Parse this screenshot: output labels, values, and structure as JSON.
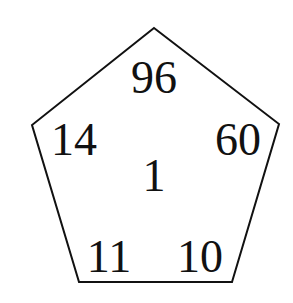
{
  "diagram": {
    "shape": "pentagon",
    "stroke_color": "#111111",
    "vertices": [
      [
        154,
        28
      ],
      [
        279,
        124
      ],
      [
        232,
        282
      ],
      [
        79,
        282
      ],
      [
        32,
        125
      ]
    ],
    "numbers": {
      "top": "96",
      "upper_left": "14",
      "upper_right": "60",
      "center": "1",
      "lower_left": "11",
      "lower_right": "10"
    }
  }
}
